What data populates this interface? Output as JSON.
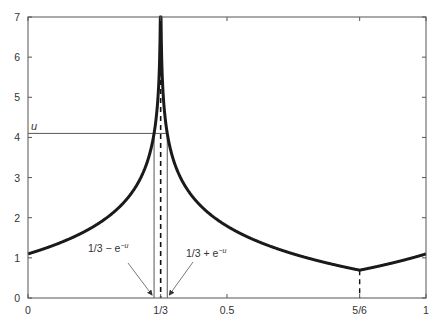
{
  "chart_data": {
    "type": "line",
    "title": "",
    "xlabel": "",
    "ylabel": "",
    "xlim": [
      0,
      1
    ],
    "ylim": [
      0,
      7
    ],
    "grid": false,
    "legend": null,
    "x_ticks": [
      {
        "value": 0,
        "label": "0"
      },
      {
        "value": 0.3333333,
        "label": "1/3"
      },
      {
        "value": 0.5,
        "label": "0.5"
      },
      {
        "value": 0.8333333,
        "label": "5/6"
      },
      {
        "value": 1,
        "label": "1"
      }
    ],
    "y_ticks": [
      {
        "value": 0,
        "label": "0"
      },
      {
        "value": 1,
        "label": "1"
      },
      {
        "value": 2,
        "label": "2"
      },
      {
        "value": 3,
        "label": "3"
      },
      {
        "value": 4,
        "label": "4"
      },
      {
        "value": 5,
        "label": "5"
      },
      {
        "value": 6,
        "label": "6"
      },
      {
        "value": 7,
        "label": "7"
      }
    ],
    "series": [
      {
        "name": "f(x) = -ln(dist(x, 1/3))",
        "description": "Curve with logarithmic singularity at x=1/3, kink minimum at x=5/6",
        "x": [
          0,
          0.1,
          0.2,
          0.25,
          0.3,
          0.32,
          0.33,
          0.3333,
          0.337,
          0.35,
          0.4,
          0.5,
          0.6,
          0.7,
          0.8333,
          0.9,
          1
        ],
        "y": [
          1.1,
          1.45,
          2.01,
          2.48,
          3.4,
          4.32,
          5.7,
          7.0,
          5.6,
          4.09,
          2.71,
          1.79,
          1.32,
          1.0,
          0.69,
          0.89,
          1.1
        ]
      }
    ],
    "annotations": [
      {
        "type": "hline",
        "y": 4.1,
        "label": "u",
        "from_x": 0,
        "to_x": 0.35
      },
      {
        "type": "vline",
        "x": 0.3167,
        "label": "1/3 − e^−u",
        "style": "solid"
      },
      {
        "type": "vline",
        "x": 0.3499,
        "label": "1/3 + e^−u",
        "style": "solid"
      },
      {
        "type": "vline",
        "x": 0.3333,
        "style": "dashed"
      },
      {
        "type": "vline",
        "x": 0.8333,
        "style": "dashed",
        "to_y": 0.69
      }
    ]
  },
  "labels": {
    "u": "u",
    "left_annot_base": "1/3 − e",
    "right_annot_base": "1/3 + e",
    "exp_sup": "−u"
  }
}
